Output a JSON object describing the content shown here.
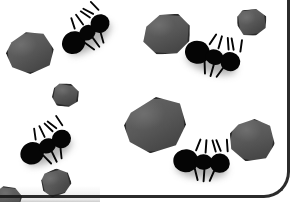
{
  "scene": {
    "title": "Ants and Rocks",
    "description": "Black ant silhouettes scattered among gray polygonal rocks on a white background",
    "width": 293,
    "height": 202,
    "background_color": "#ffffff",
    "frame_color": "#1a1a1a",
    "rock_fill_color": "#5a5a5a",
    "rock_outline_color": "#2b2b2b",
    "ant_color": "#050505",
    "shadow_color": "#3c3c3c"
  },
  "counts": {
    "ants": 4,
    "rocks": 8
  },
  "rocks": [
    {
      "id": "rock-left-upper",
      "label": "rock",
      "x": 6,
      "y": 31,
      "w": 48,
      "h": 43,
      "shape": "p1",
      "rotate": -6
    },
    {
      "id": "rock-small-upper",
      "label": "rock",
      "x": 52,
      "y": 83,
      "w": 27,
      "h": 24,
      "shape": "p2",
      "rotate": 10
    },
    {
      "id": "rock-top-center",
      "label": "rock",
      "x": 142,
      "y": 13,
      "w": 48,
      "h": 42,
      "shape": "p3",
      "rotate": 4
    },
    {
      "id": "rock-top-right",
      "label": "rock",
      "x": 237,
      "y": 8,
      "w": 30,
      "h": 28,
      "shape": "p4",
      "rotate": -8
    },
    {
      "id": "rock-center-large",
      "label": "rock",
      "x": 124,
      "y": 97,
      "w": 62,
      "h": 56,
      "shape": "p5",
      "rotate": -3
    },
    {
      "id": "rock-right-middle",
      "label": "rock",
      "x": 229,
      "y": 118,
      "w": 46,
      "h": 44,
      "shape": "p1",
      "rotate": 12
    },
    {
      "id": "rock-bottom-left",
      "label": "rock",
      "x": 41,
      "y": 169,
      "w": 30,
      "h": 27,
      "shape": "p2",
      "rotate": -14
    },
    {
      "id": "rock-left-lowedge",
      "label": "rock",
      "x": -4,
      "y": 186,
      "w": 26,
      "h": 24,
      "shape": "p4",
      "rotate": 6
    }
  ],
  "ants": [
    {
      "id": "ant-top-left",
      "label": "ant",
      "x": 56,
      "y": 18,
      "rotate": -36,
      "scale": 0.92
    },
    {
      "id": "ant-top-right",
      "label": "ant",
      "x": 183,
      "y": 42,
      "rotate": 16,
      "scale": 0.96
    },
    {
      "id": "ant-bottom-left",
      "label": "ant",
      "x": 16,
      "y": 131,
      "rotate": -26,
      "scale": 0.92
    },
    {
      "id": "ant-bottom-right",
      "label": "ant",
      "x": 172,
      "y": 147,
      "rotate": 4,
      "scale": 0.96
    }
  ]
}
